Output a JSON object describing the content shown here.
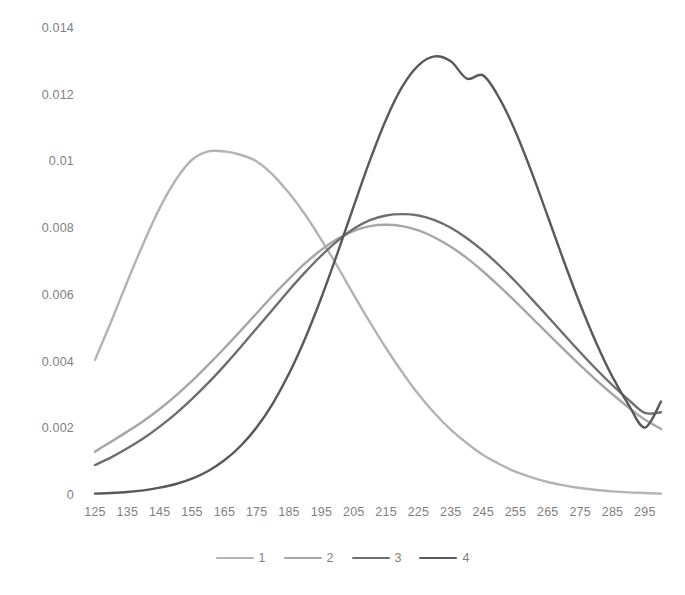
{
  "chart_data": {
    "type": "line",
    "title": "",
    "subtitle": "",
    "xlabel": "",
    "ylabel": "",
    "xlim": [
      125,
      300
    ],
    "ylim": [
      0,
      0.014
    ],
    "grid": false,
    "legend_position": "bottom-center",
    "x_tick_labels": [
      "125",
      "135",
      "145",
      "155",
      "165",
      "175",
      "185",
      "195",
      "205",
      "215",
      "225",
      "235",
      "245",
      "255",
      "265",
      "275",
      "285",
      "295"
    ],
    "x_ticks": [
      125,
      135,
      145,
      155,
      165,
      175,
      185,
      195,
      205,
      215,
      225,
      235,
      245,
      255,
      265,
      275,
      285,
      295
    ],
    "y_tick_labels": [
      "0",
      "0.002",
      "0.004",
      "0.006",
      "0.008",
      "0.01",
      "0.012",
      "0.014"
    ],
    "y_ticks": [
      0,
      0.002,
      0.004,
      0.006,
      0.008,
      0.01,
      0.012,
      0.014
    ],
    "x": [
      125,
      130,
      135,
      140,
      145,
      150,
      155,
      160,
      165,
      170,
      175,
      180,
      185,
      190,
      195,
      200,
      205,
      210,
      215,
      220,
      225,
      230,
      235,
      240,
      245,
      250,
      255,
      260,
      265,
      270,
      275,
      280,
      285,
      290,
      295,
      300
    ],
    "series": [
      {
        "name": "1",
        "color": "#b3b3b3",
        "peak_x": 177,
        "peak_y": 0.0103,
        "values": [
          0.00405,
          0.0052,
          0.0064,
          0.00755,
          0.0086,
          0.00945,
          0.01005,
          0.0103,
          0.0103,
          0.0102,
          0.01,
          0.0096,
          0.00905,
          0.0084,
          0.00765,
          0.00685,
          0.006,
          0.00518,
          0.0044,
          0.00368,
          0.00302,
          0.00245,
          0.00196,
          0.00155,
          0.0012,
          0.00093,
          0.0007,
          0.00053,
          0.00039,
          0.00029,
          0.00021,
          0.00015,
          0.00011,
          8e-05,
          6e-05,
          4e-05
        ]
      },
      {
        "name": "2",
        "color": "#a6a6a6",
        "peak_x": 218,
        "peak_y": 0.0081,
        "values": [
          0.0013,
          0.0016,
          0.0019,
          0.00222,
          0.00258,
          0.00298,
          0.00342,
          0.0039,
          0.0044,
          0.00492,
          0.00545,
          0.00598,
          0.00648,
          0.00695,
          0.00735,
          0.00768,
          0.00792,
          0.00806,
          0.0081,
          0.00806,
          0.00793,
          0.00772,
          0.00744,
          0.0071,
          0.0067,
          0.00626,
          0.0058,
          0.00532,
          0.00484,
          0.00436,
          0.00389,
          0.00344,
          0.00302,
          0.00262,
          0.00226,
          0.00198
        ]
      },
      {
        "name": "3",
        "color": "#6e6e6e",
        "peak_x": 226,
        "peak_y": 0.0084,
        "values": [
          0.0009,
          0.00113,
          0.0014,
          0.0017,
          0.00205,
          0.00244,
          0.00288,
          0.00336,
          0.00388,
          0.00443,
          0.005,
          0.00557,
          0.00614,
          0.00668,
          0.00718,
          0.00762,
          0.00798,
          0.00824,
          0.00838,
          0.00842,
          0.00838,
          0.00824,
          0.00801,
          0.0077,
          0.00732,
          0.00688,
          0.0064,
          0.00588,
          0.00535,
          0.00481,
          0.00428,
          0.00377,
          0.00329,
          0.00285,
          0.00246,
          0.00248
        ]
      },
      {
        "name": "4",
        "color": "#595959",
        "peak_x": 245,
        "peak_y": 0.0126,
        "values": [
          4e-05,
          6e-05,
          9e-05,
          0.00014,
          0.00022,
          0.00033,
          0.00049,
          0.00072,
          0.00104,
          0.00147,
          0.00203,
          0.00275,
          0.00364,
          0.0047,
          0.00592,
          0.00726,
          0.00866,
          0.01003,
          0.01126,
          0.01224,
          0.01288,
          0.01315,
          0.013,
          0.01248,
          0.01258,
          0.0119,
          0.0109,
          0.00968,
          0.00835,
          0.007,
          0.00572,
          0.00456,
          0.00354,
          0.0027,
          0.00202,
          0.0028
        ]
      }
    ]
  },
  "legend": {
    "items": [
      {
        "label": "1",
        "color": "#b3b3b3"
      },
      {
        "label": "2",
        "color": "#a6a6a6"
      },
      {
        "label": "3",
        "color": "#6e6e6e"
      },
      {
        "label": "4",
        "color": "#595959"
      }
    ]
  }
}
